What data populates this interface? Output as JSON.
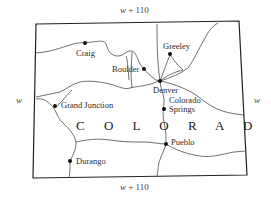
{
  "state_name": "C O L O R A D O",
  "dimensions": {
    "top": {
      "var": "w",
      "expr": " + 110"
    },
    "bottom": {
      "var": "w",
      "expr": " + 110"
    },
    "left": "w",
    "right": "w"
  },
  "cities": [
    {
      "name": "Craig"
    },
    {
      "name": "Greeley"
    },
    {
      "name": "Boulder"
    },
    {
      "name": "Denver"
    },
    {
      "name": "Grand Junction"
    },
    {
      "name": "Colorado"
    },
    {
      "name": "Springs"
    },
    {
      "name": "Pueblo"
    },
    {
      "name": "Durango"
    }
  ]
}
